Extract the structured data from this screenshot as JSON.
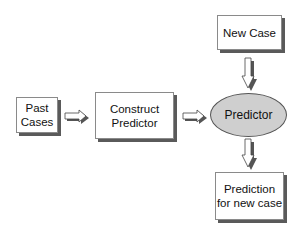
{
  "diagram": {
    "title": "",
    "nodes": {
      "past_cases": {
        "line1": "Past",
        "line2": "Cases"
      },
      "construct_predictor": {
        "line1": "Construct",
        "line2": "Predictor"
      },
      "predictor": {
        "label": "Predictor"
      },
      "new_case": {
        "label": "New Case"
      },
      "prediction": {
        "line1": "Prediction",
        "line2": "for new case"
      }
    },
    "edges": [
      {
        "from": "Past Cases",
        "to": "Construct Predictor",
        "direction": "right"
      },
      {
        "from": "Construct Predictor",
        "to": "Predictor",
        "direction": "right"
      },
      {
        "from": "New Case",
        "to": "Predictor",
        "direction": "down"
      },
      {
        "from": "Predictor",
        "to": "Prediction for new case",
        "direction": "down"
      }
    ],
    "colors": {
      "box_fill": "#ffffff",
      "box_border": "#8a8a8a",
      "shadow": "#5a5a5a",
      "ellipse_fill": "#cfcfcf"
    }
  }
}
